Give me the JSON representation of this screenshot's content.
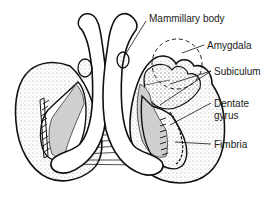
{
  "figure": {
    "labels": {
      "mammillary_body": "Mammillary body",
      "amygdala": "Amygdala",
      "subiculum": "Subiculum",
      "dentate_gyrus_line1": "Dentate",
      "dentate_gyrus_line2": "gyrus",
      "fimbria": "Fimbria"
    },
    "colors": {
      "stroke": "#111111",
      "shading": "#cfcfcf",
      "background": "#ffffff"
    }
  }
}
